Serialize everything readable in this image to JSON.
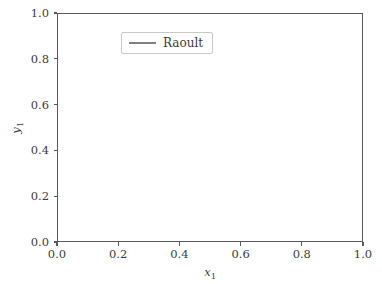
{
  "figure": {
    "background": "#ffffff",
    "axes_color": "#5a5a5a",
    "text_color": "#3b3b3b"
  },
  "axis": {
    "xlabel_text": "x",
    "xlabel_sub": "1",
    "ylabel_text": "y",
    "ylabel_sub": "1"
  },
  "legend": {
    "entries": [
      {
        "label": "Raoult",
        "color": "#808080"
      }
    ]
  },
  "chart_data": {
    "type": "line",
    "title": "",
    "xlabel": "x₁",
    "ylabel": "y₁",
    "xlim": [
      0.0,
      1.0
    ],
    "ylim": [
      0.0,
      1.0
    ],
    "xticks": [
      0.0,
      0.2,
      0.4,
      0.6,
      0.8,
      1.0
    ],
    "yticks": [
      0.0,
      0.2,
      0.4,
      0.6,
      0.8,
      1.0
    ],
    "xtick_labels": [
      "0.0",
      "0.2",
      "0.4",
      "0.6",
      "0.8",
      "1.0"
    ],
    "ytick_labels": [
      "0.0",
      "0.2",
      "0.4",
      "0.6",
      "0.8",
      "1.0"
    ],
    "grid": false,
    "legend_position": "upper left",
    "series": [
      {
        "name": "Raoult",
        "color": "#808080",
        "linewidth": 2.1,
        "show_in_legend": true,
        "x": [
          0.0,
          0.05,
          0.1,
          0.15,
          0.2,
          0.25,
          0.3,
          0.35,
          0.4,
          0.45,
          0.5,
          0.55,
          0.6,
          0.65,
          0.7,
          0.75,
          0.8,
          0.85,
          0.9,
          0.95,
          1.0
        ],
        "values": [
          0.0,
          0.116,
          0.217,
          0.306,
          0.385,
          0.455,
          0.517,
          0.574,
          0.625,
          0.672,
          0.714,
          0.753,
          0.789,
          0.823,
          0.854,
          0.882,
          0.909,
          0.934,
          0.957,
          0.979,
          1.0
        ]
      },
      {
        "name": "y = x diagonal",
        "color": "#1a1a1a",
        "linewidth": 1.1,
        "show_in_legend": false,
        "x": [
          0.0,
          1.0
        ],
        "values": [
          0.0,
          1.0
        ]
      }
    ]
  }
}
